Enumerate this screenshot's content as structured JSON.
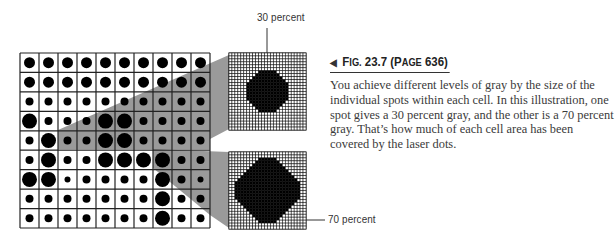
{
  "figure": {
    "label_top": "30 percent",
    "label_bottom": "70 percent",
    "grid": {
      "columns": 10,
      "rows": 9,
      "dot_size_legend": {
        "xs": 6,
        "s": 8,
        "m": 11,
        "l": 15
      },
      "cells": [
        [
          "m",
          "m",
          "m",
          "m",
          "m",
          "m",
          "m",
          "m",
          "m",
          "m"
        ],
        [
          "m",
          "m",
          "m",
          "m",
          "m",
          "m",
          "m",
          "m",
          "m",
          "m"
        ],
        [
          "s",
          "s",
          "s",
          "s",
          "s",
          "s",
          "s",
          "s",
          "s",
          "s"
        ],
        [
          "l",
          "s",
          "s",
          "s",
          "l",
          "l",
          "s",
          "s",
          "s",
          "s"
        ],
        [
          "s",
          "l",
          "s",
          "s",
          "l",
          "l",
          "s",
          "s",
          "s",
          "s"
        ],
        [
          "s",
          "l",
          "s",
          "s",
          "l",
          "l",
          "l",
          "l",
          "s",
          "s"
        ],
        [
          "l",
          "l",
          "xs",
          "s",
          "s",
          "s",
          "s",
          "l",
          "s",
          "xs"
        ],
        [
          "s",
          "s",
          "s",
          "s",
          "s",
          "s",
          "s",
          "l",
          "s",
          "s"
        ],
        [
          "s",
          "s",
          "s",
          "s",
          "s",
          "s",
          "s",
          "l",
          "s",
          "s"
        ]
      ]
    },
    "colors": {
      "beam": "#9a9a9a",
      "dot": "#000000",
      "grid_line": "#222222"
    }
  },
  "caption": {
    "arrow_icon": "◀",
    "fig_prefix_cap": "F",
    "fig_prefix_sc": "IG.",
    "fig_number": " 23.7 (",
    "page_cap": "P",
    "page_sc": "AGE",
    "page_number": " 636)",
    "body": "You achieve different levels of gray by the size of the individual spots within each cell. In this illustration, one spot gives a 30 percent gray, and the other is a 70 percent gray. That’s how much of each cell area has been covered by the laser dots."
  }
}
